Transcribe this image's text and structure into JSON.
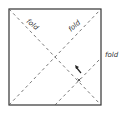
{
  "diagram": {
    "title": "",
    "square": {
      "x": 9,
      "y": 9,
      "w": 92,
      "h": 96,
      "stroke": "#333333"
    },
    "folds": [
      {
        "id": "fold-diagonal-1",
        "label": "fold",
        "from": [
          9,
          9
        ],
        "to": [
          101,
          105
        ]
      },
      {
        "id": "fold-diagonal-2",
        "label": "fold",
        "from": [
          9,
          105
        ],
        "to": [
          101,
          9
        ]
      },
      {
        "id": "fold-corner",
        "label": "fold",
        "from": [
          55,
          105
        ],
        "to": [
          101,
          58
        ]
      }
    ],
    "labels": {
      "fold1": "fold",
      "fold2": "fold",
      "fold3": "fold"
    },
    "arrow": {
      "direction": "up-left",
      "at": [
        78,
        70
      ]
    },
    "mark": {
      "symbol": "x",
      "at": [
        79,
        80
      ]
    }
  }
}
